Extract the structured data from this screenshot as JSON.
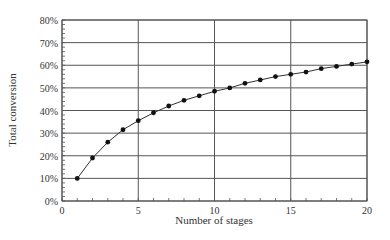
{
  "chart_data": {
    "type": "line",
    "title": "",
    "xlabel": "Number of stages",
    "ylabel": "Total conversion",
    "xlim": [
      0,
      20
    ],
    "ylim": [
      0,
      80
    ],
    "x_ticks": [
      0,
      5,
      10,
      15,
      20
    ],
    "y_ticks": [
      0,
      10,
      20,
      30,
      40,
      50,
      60,
      70,
      80
    ],
    "y_tick_labels": [
      "0%",
      "10%",
      "20%",
      "30%",
      "40%",
      "50%",
      "60%",
      "70%",
      "80%"
    ],
    "x_tick_labels": [
      "0",
      "5",
      "10",
      "15",
      "20"
    ],
    "grid": true,
    "legend": null,
    "series": [
      {
        "name": "Total conversion",
        "x": [
          1,
          2,
          3,
          4,
          5,
          6,
          7,
          8,
          9,
          10,
          11,
          12,
          13,
          14,
          15,
          16,
          17,
          18,
          19,
          20
        ],
        "values": [
          10,
          19,
          26,
          31.5,
          35.5,
          39,
          42,
          44.5,
          46.5,
          48.5,
          50,
          52,
          53.5,
          55,
          56,
          57,
          58.5,
          59.5,
          60.5,
          61.5
        ]
      }
    ],
    "colors": {
      "line": "#333333",
      "grid": "#555555",
      "marker": "#111111"
    }
  }
}
